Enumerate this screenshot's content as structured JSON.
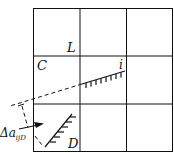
{
  "diagram": {
    "grid": {
      "rows": 3,
      "cols": 3
    },
    "labels": {
      "L": "L",
      "C": "C",
      "i": "i",
      "D": "D",
      "delta": "Δa",
      "delta_sub": "ijD"
    },
    "colors": {
      "line": "#111111",
      "background": "#ffffff"
    }
  }
}
